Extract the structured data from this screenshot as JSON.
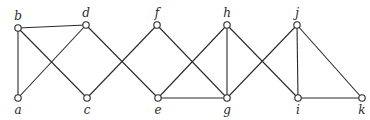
{
  "diagram": {
    "type": "graph",
    "nodes": [
      {
        "id": "a",
        "label": "a",
        "x": 18,
        "y": 98,
        "label_pos": "below"
      },
      {
        "id": "b",
        "label": "b",
        "x": 18,
        "y": 28,
        "label_pos": "above"
      },
      {
        "id": "c",
        "label": "c",
        "x": 87,
        "y": 98,
        "label_pos": "below"
      },
      {
        "id": "d",
        "label": "d",
        "x": 86,
        "y": 25,
        "label_pos": "above"
      },
      {
        "id": "e",
        "label": "e",
        "x": 158,
        "y": 98,
        "label_pos": "below"
      },
      {
        "id": "f",
        "label": "f",
        "x": 157,
        "y": 25,
        "label_pos": "above"
      },
      {
        "id": "g",
        "label": "g",
        "x": 227,
        "y": 98,
        "label_pos": "below"
      },
      {
        "id": "h",
        "label": "h",
        "x": 227,
        "y": 25,
        "label_pos": "above"
      },
      {
        "id": "i",
        "label": "i",
        "x": 298,
        "y": 98,
        "label_pos": "below"
      },
      {
        "id": "j",
        "label": "j",
        "x": 297,
        "y": 25,
        "label_pos": "above"
      },
      {
        "id": "k",
        "label": "k",
        "x": 362,
        "y": 98,
        "label_pos": "below"
      }
    ],
    "edges": [
      [
        "b",
        "d"
      ],
      [
        "b",
        "a"
      ],
      [
        "b",
        "c"
      ],
      [
        "a",
        "d"
      ],
      [
        "d",
        "e"
      ],
      [
        "c",
        "f"
      ],
      [
        "f",
        "g"
      ],
      [
        "e",
        "h"
      ],
      [
        "e",
        "g"
      ],
      [
        "h",
        "g"
      ],
      [
        "h",
        "i"
      ],
      [
        "g",
        "j"
      ],
      [
        "j",
        "i"
      ],
      [
        "j",
        "k"
      ],
      [
        "i",
        "k"
      ]
    ]
  }
}
